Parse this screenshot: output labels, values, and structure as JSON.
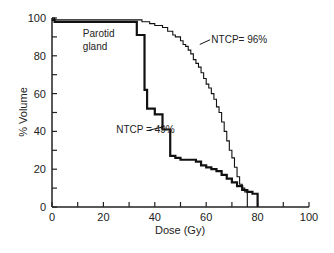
{
  "chart_data": {
    "type": "line",
    "title": "",
    "xlabel": "Dose (Gy)",
    "ylabel": "% Volume",
    "xlim": [
      0,
      100
    ],
    "ylim": [
      0,
      100
    ],
    "x_ticks": [
      0,
      20,
      40,
      60,
      80,
      100
    ],
    "x_minor_ticks": [
      10,
      30,
      50,
      70,
      90
    ],
    "y_ticks": [
      0,
      20,
      40,
      60,
      80,
      100
    ],
    "y_minor_ticks": [
      10,
      30,
      50,
      70,
      90
    ],
    "grid": false,
    "legend": null,
    "annotations": [
      {
        "text": "Parotid",
        "x": 12,
        "y": 90
      },
      {
        "text": "gland",
        "x": 12,
        "y": 83
      },
      {
        "text": "NTCP= 96%",
        "x": 62,
        "y": 87,
        "points_to_series": "NTCP=96%"
      },
      {
        "text": "NTCP = 49%",
        "x": 25,
        "y": 39,
        "points_to_series": "NTCP=49%"
      }
    ],
    "series": [
      {
        "name": "NTCP=96%",
        "style": "thin",
        "x": [
          0,
          1,
          33,
          35,
          38,
          40,
          43,
          45,
          47,
          48,
          50,
          51,
          52,
          53,
          54,
          55,
          56,
          57,
          58,
          59,
          60,
          61,
          62,
          63,
          64,
          65,
          66,
          67,
          68,
          69,
          70,
          71,
          72,
          73,
          74,
          75,
          76,
          76
        ],
        "y": [
          100,
          99,
          99,
          98,
          97,
          96,
          95,
          93,
          91,
          90,
          88,
          86,
          85,
          83,
          81,
          78,
          76,
          74,
          71,
          68,
          65,
          63,
          60,
          57,
          53,
          50,
          45,
          40,
          35,
          30,
          26,
          21,
          16,
          12,
          10,
          8,
          7,
          0
        ]
      },
      {
        "name": "NTCP=49%",
        "style": "thick",
        "x": [
          0,
          1,
          32,
          33,
          36,
          37,
          40,
          43,
          46,
          48,
          50,
          54,
          56,
          58,
          60,
          62,
          64,
          66,
          68,
          70,
          72,
          74,
          76,
          78,
          80,
          80
        ],
        "y": [
          99,
          98,
          98,
          91,
          62,
          52,
          49,
          41,
          27,
          26,
          25,
          25,
          24,
          22,
          21,
          20,
          19,
          17,
          15,
          13,
          11,
          9,
          8,
          7,
          6,
          0
        ]
      }
    ]
  }
}
